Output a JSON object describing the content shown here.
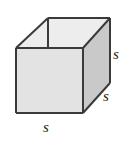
{
  "figure": {
    "name": "cube-diagram",
    "canvas": {
      "width": 132,
      "height": 142,
      "background": "#ffffff"
    },
    "colors": {
      "stroke": "#3a3a3a",
      "front_face": "#e3e3e3",
      "right_face": "#c9c9c9",
      "top_face": "#ededed",
      "label_text": "#1a1a1a"
    },
    "stroke_width": 2,
    "vertices": {
      "front_top_left": [
        16,
        48
      ],
      "front_top_right": [
        83,
        48
      ],
      "front_bottom_left": [
        16,
        113
      ],
      "front_bottom_right": [
        83,
        113
      ],
      "back_top_left": [
        48,
        18
      ],
      "back_top_right": [
        110,
        18
      ],
      "back_bottom_right": [
        110,
        83
      ]
    },
    "faces": {
      "front": "16,48 83,48 83,113 16,113",
      "right": "83,48 110,18 110,83 83,113",
      "top": "16,48 48,18 110,18 83,48"
    },
    "hidden_edge": {
      "from": [
        48,
        18
      ],
      "to": [
        48,
        48
      ]
    }
  },
  "labels": {
    "right_vertical": "s",
    "right_depth": "s",
    "bottom_width": "s"
  }
}
